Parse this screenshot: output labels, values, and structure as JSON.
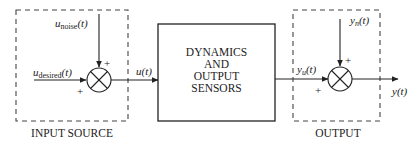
{
  "diagram": {
    "input_source": {
      "label": "INPUT SOURCE",
      "noise_signal": {
        "base": "u",
        "sub": "noise",
        "arg": "(t)"
      },
      "desired_signal": {
        "base": "u",
        "sub": "desired",
        "arg": "(t)"
      },
      "junction": {
        "type": "summing-junction",
        "top_sign": "+",
        "left_sign": "+"
      }
    },
    "link_input": {
      "label": "u(t)"
    },
    "main_block": {
      "lines": [
        "DYNAMICS",
        "AND",
        "OUTPUT",
        "SENSORS"
      ]
    },
    "link_output": {
      "base": "y",
      "sub": "u",
      "arg": "(t)"
    },
    "output": {
      "label": "OUTPUT",
      "noise_signal": {
        "base": "y",
        "sub": "n",
        "arg": "(t)"
      },
      "junction": {
        "type": "summing-junction",
        "top_sign": "+",
        "left_sign": "+"
      },
      "final_signal": {
        "label": "y(t)"
      }
    },
    "colors": {
      "stroke": "#222222",
      "background": "#ffffff"
    }
  }
}
